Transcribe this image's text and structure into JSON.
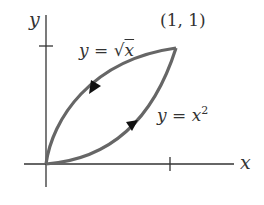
{
  "diagram": {
    "axes": {
      "x_label": "x",
      "y_label": "y"
    },
    "point_label": "(1, 1)",
    "curves": [
      {
        "name": "sqrt",
        "eq_lhs": "y = ",
        "eq_rad": "√",
        "eq_var": "x",
        "direction": "from (1,1) to (0,0)"
      },
      {
        "name": "square",
        "eq_lhs": "y = ",
        "eq_var": "x",
        "eq_exp": "2",
        "direction": "from (0,0) to (1,1)"
      }
    ],
    "colors": {
      "curve": "#666666",
      "axis": "#333333",
      "text": "#333333"
    }
  }
}
